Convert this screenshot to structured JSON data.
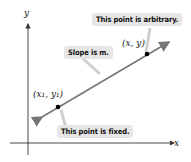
{
  "axes": {
    "x_label": "x",
    "y_label": "y"
  },
  "line": {
    "color": "#7a7a7a"
  },
  "points": [
    {
      "id": "fixed",
      "label": "(x₁, y₁)",
      "callout": "This point is fixed."
    },
    {
      "id": "arbitrary",
      "label": "(x, y)",
      "callout": "This point is arbitrary."
    }
  ],
  "slope_callout": "Slope is m.",
  "colors": {
    "callout_bg": "#e6e6e6",
    "axis": "#333333",
    "point": "#000000"
  }
}
